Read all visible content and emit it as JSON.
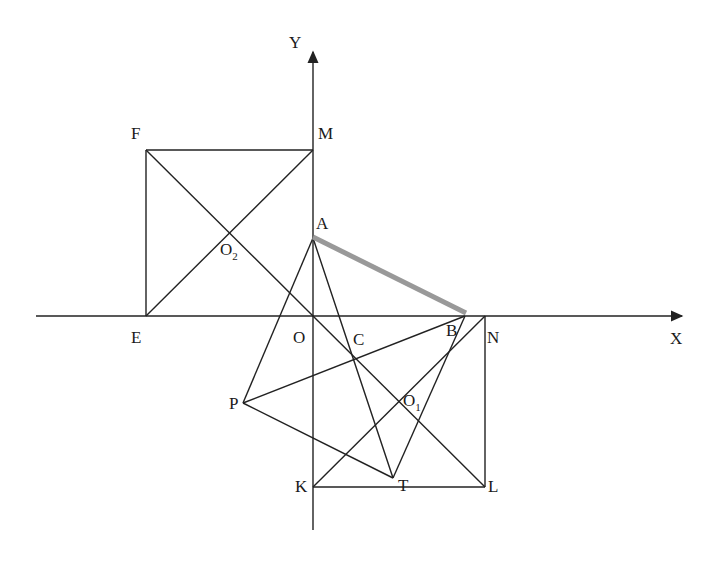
{
  "diagram": {
    "type": "geometry-coordinate-diagram",
    "axes": {
      "x_label": "X",
      "y_label": "Y",
      "origin_label": "O"
    },
    "points": {
      "O": {
        "label": "O",
        "x": 313,
        "y": 316
      },
      "A": {
        "label": "A",
        "x": 313,
        "y": 238
      },
      "B": {
        "label": "B",
        "x": 465,
        "y": 316
      },
      "N": {
        "label": "N",
        "x": 485,
        "y": 316
      },
      "K": {
        "label": "K",
        "x": 313,
        "y": 487
      },
      "L": {
        "label": "L",
        "x": 485,
        "y": 487
      },
      "T": {
        "label": "T",
        "x": 393,
        "y": 478
      },
      "P": {
        "label": "P",
        "x": 243,
        "y": 403
      },
      "C": {
        "label": "C",
        "x": 355,
        "y": 356
      },
      "O1": {
        "label": "O",
        "sub": "1",
        "x": 399,
        "y": 402
      },
      "E": {
        "label": "E",
        "x": 146,
        "y": 316
      },
      "F": {
        "label": "F",
        "x": 146,
        "y": 150
      },
      "M": {
        "label": "M",
        "x": 313,
        "y": 150
      },
      "O2": {
        "label": "O",
        "sub": "2",
        "x": 229,
        "y": 233
      }
    },
    "highlighted_segment": {
      "from": "A",
      "to": "B",
      "color": "#999999"
    },
    "segments": [
      [
        "F",
        "M"
      ],
      [
        "F",
        "E"
      ],
      [
        "M",
        "O"
      ],
      [
        "F",
        "O"
      ],
      [
        "E",
        "M"
      ],
      [
        "A",
        "P"
      ],
      [
        "A",
        "T"
      ],
      [
        "P",
        "T"
      ],
      [
        "P",
        "B"
      ],
      [
        "B",
        "T"
      ],
      [
        "O",
        "L"
      ],
      [
        "K",
        "N"
      ],
      [
        "N",
        "L"
      ],
      [
        "K",
        "L"
      ]
    ]
  }
}
